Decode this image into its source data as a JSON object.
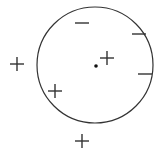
{
  "diagram": {
    "stroke_color": "#333333",
    "circle": {
      "cx": 95,
      "cy": 65,
      "r": 58
    },
    "center_point": {
      "x": 96,
      "y": 66
    },
    "markers": [
      {
        "type": "minus",
        "x": 82,
        "y": 23,
        "inside": true
      },
      {
        "type": "minus",
        "x": 139,
        "y": 34,
        "inside": true
      },
      {
        "type": "minus",
        "x": 145,
        "y": 74,
        "inside": true
      },
      {
        "type": "plus",
        "x": 107,
        "y": 58,
        "inside": true
      },
      {
        "type": "plus",
        "x": 55,
        "y": 91,
        "inside": true
      },
      {
        "type": "plus",
        "x": 17,
        "y": 64,
        "inside": false
      },
      {
        "type": "plus",
        "x": 82,
        "y": 141,
        "inside": false
      }
    ]
  }
}
